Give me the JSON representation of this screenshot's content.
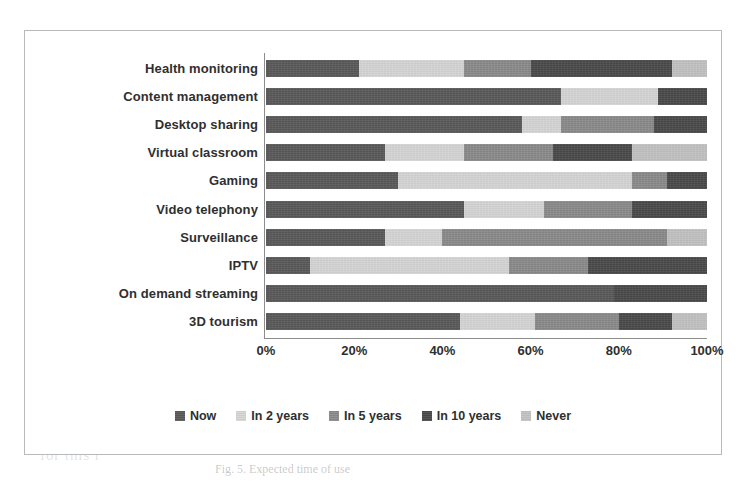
{
  "chart_data": {
    "type": "bar",
    "subtype": "stacked-horizontal-100percent",
    "title": "",
    "xlabel": "",
    "ylabel": "",
    "xlim": [
      0,
      100
    ],
    "xticks": [
      "0%",
      "20%",
      "40%",
      "60%",
      "80%",
      "100%"
    ],
    "xtick_values": [
      0,
      20,
      40,
      60,
      80,
      100
    ],
    "grid": false,
    "legend_position": "bottom",
    "categories": [
      "Health monitoring",
      "Content management",
      "Desktop sharing",
      "Virtual classroom",
      "Gaming",
      "Video telephony",
      "Surveillance",
      "IPTV",
      "On demand streaming",
      "3D tourism"
    ],
    "series": [
      {
        "name": "Now",
        "color": "#595959",
        "values": [
          21,
          67,
          58,
          27,
          30,
          45,
          27,
          10,
          79,
          44
        ]
      },
      {
        "name": "In 2 years",
        "color": "#d5d5d5",
        "values": [
          24,
          22,
          9,
          18,
          53,
          18,
          13,
          45,
          0,
          17
        ]
      },
      {
        "name": "In 5 years",
        "color": "#8a8a8a",
        "values": [
          15,
          0,
          21,
          20,
          8,
          20,
          51,
          18,
          0,
          19
        ]
      },
      {
        "name": "In 10 years",
        "color": "#4a4a4a",
        "values": [
          32,
          11,
          12,
          18,
          9,
          17,
          0,
          27,
          21,
          12
        ]
      },
      {
        "name": "Never",
        "color": "#c2c2c2",
        "values": [
          8,
          0,
          0,
          17,
          0,
          0,
          9,
          0,
          0,
          8
        ]
      }
    ]
  },
  "legend": {
    "items": [
      {
        "label": "Now",
        "color": "#595959"
      },
      {
        "label": "In 2 years",
        "color": "#d5d5d5"
      },
      {
        "label": "In 5 years",
        "color": "#8a8a8a"
      },
      {
        "label": "In 10 years",
        "color": "#4a4a4a"
      },
      {
        "label": "Never",
        "color": "#c2c2c2"
      }
    ]
  },
  "page_background": {
    "ghost_line_1": "of the future and that one can im",
    "ghost_line_2": "is not needed",
    "ghost_line_3": "t, the f",
    "ghost_line_4": "for this r",
    "caption": "Fig. 5. Expected time of use"
  }
}
